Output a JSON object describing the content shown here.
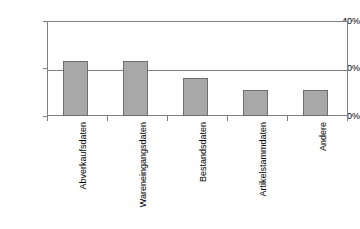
{
  "chart_data": {
    "type": "bar",
    "title": "",
    "subtitle": "",
    "xlabel": "",
    "ylabel": "",
    "categories": [
      "Abverkaufsdaten",
      "Wareneingangsdaten",
      "Bestandsdaten",
      "Artikelstammdaten",
      "Andere"
    ],
    "values": [
      23,
      23,
      16,
      11,
      11
    ],
    "ylim": [
      0,
      40
    ],
    "ytick_values": [
      0,
      20,
      40
    ],
    "ytick_labels": [
      "0%",
      "20%",
      "40%"
    ],
    "grid": true,
    "legend": false,
    "legend_position": "none",
    "bar_fill_color": "#a8a8a8",
    "bar_border_color": "#6e6e6e",
    "axis_color": "#808080",
    "text_color": "#000000",
    "background_color": "#ffffff",
    "value_unit": "%",
    "annotations": []
  }
}
